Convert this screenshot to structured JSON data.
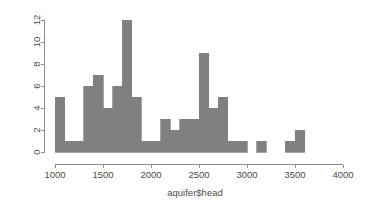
{
  "chart_data": {
    "type": "bar",
    "subtype": "histogram",
    "title": "",
    "xlabel": "aquifer$head",
    "ylabel": "",
    "bin_width": 100,
    "bin_starts": [
      1000,
      1100,
      1200,
      1300,
      1400,
      1500,
      1600,
      1700,
      1800,
      1900,
      2000,
      2100,
      2200,
      2300,
      2400,
      2500,
      2600,
      2700,
      2800,
      2900,
      3000,
      3100,
      3200,
      3300,
      3400,
      3500
    ],
    "bin_ends": [
      1100,
      1200,
      1300,
      1400,
      1500,
      1600,
      1700,
      1800,
      1900,
      2000,
      2100,
      2200,
      2300,
      2400,
      2500,
      2600,
      2700,
      2800,
      2900,
      3000,
      3100,
      3200,
      3300,
      3400,
      3500,
      3600
    ],
    "categories": [
      "1000-1100",
      "1100-1200",
      "1200-1300",
      "1300-1400",
      "1400-1500",
      "1500-1600",
      "1600-1700",
      "1700-1800",
      "1800-1900",
      "1900-2000",
      "2000-2100",
      "2100-2200",
      "2200-2300",
      "2300-2400",
      "2400-2500",
      "2500-2600",
      "2600-2700",
      "2700-2800",
      "2800-2900",
      "2900-3000",
      "3000-3100",
      "3100-3200",
      "3200-3300",
      "3300-3400",
      "3400-3500",
      "3500-3600"
    ],
    "values": [
      5,
      1,
      1,
      6,
      7,
      4,
      6,
      12,
      5,
      1,
      1,
      3,
      2,
      3,
      3,
      9,
      4,
      5,
      1,
      1,
      0,
      1,
      0,
      0,
      1,
      2
    ],
    "xlim": [
      1000,
      4000
    ],
    "ylim": [
      0,
      12
    ],
    "xticks": [
      1000,
      1500,
      2000,
      2500,
      3000,
      3500,
      4000
    ],
    "xtick_labels": [
      "1000",
      "1500",
      "2000",
      "2500",
      "3000",
      "3500",
      "4000"
    ],
    "yticks": [
      0,
      2,
      4,
      6,
      8,
      10,
      12
    ],
    "ytick_labels": [
      "0",
      "2",
      "4",
      "6",
      "8",
      "10",
      "12"
    ],
    "grid": false,
    "legend": false,
    "bar_color": "#808080",
    "bar_border_color": "#808080",
    "axis_color": "#8c8c8c",
    "text_color": "#4d4d4d",
    "background_color": "#ffffff"
  }
}
